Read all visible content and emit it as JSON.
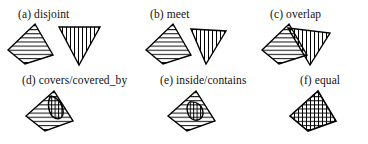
{
  "figure": {
    "background_color": "#ffffff",
    "stroke_color": "#000000",
    "panels": [
      {
        "id": "a",
        "label": "(a) disjoint",
        "relation": "disjoint",
        "shapes": [
          {
            "name": "quadrilateral-horizontal-hatch",
            "hatch": "horizontal"
          },
          {
            "name": "triangle-vertical-hatch",
            "hatch": "vertical"
          }
        ]
      },
      {
        "id": "b",
        "label": "(b) meet",
        "relation": "meet",
        "shapes": [
          {
            "name": "quadrilateral-horizontal-hatch",
            "hatch": "horizontal"
          },
          {
            "name": "triangle-vertical-hatch",
            "hatch": "vertical"
          }
        ]
      },
      {
        "id": "c",
        "label": "(c) overlap",
        "relation": "overlap",
        "shapes": [
          {
            "name": "quadrilateral-horizontal-hatch",
            "hatch": "horizontal"
          },
          {
            "name": "triangle-vertical-hatch",
            "hatch": "vertical"
          }
        ]
      },
      {
        "id": "d",
        "label": "(d) covers/covered_by",
        "relation": "covers/covered_by",
        "shapes": [
          {
            "name": "quadrilateral-horizontal-hatch",
            "hatch": "horizontal"
          },
          {
            "name": "small-lens-vertical-hatch",
            "hatch": "vertical"
          }
        ]
      },
      {
        "id": "e",
        "label": "(e) inside/contains",
        "relation": "inside/contains",
        "shapes": [
          {
            "name": "quadrilateral-horizontal-hatch",
            "hatch": "horizontal"
          },
          {
            "name": "small-lens-vertical-hatch",
            "hatch": "vertical"
          }
        ]
      },
      {
        "id": "f",
        "label": "(f) equal",
        "relation": "equal",
        "shapes": [
          {
            "name": "quadrilateral-cross-hatch",
            "hatch": "cross"
          }
        ]
      }
    ]
  }
}
